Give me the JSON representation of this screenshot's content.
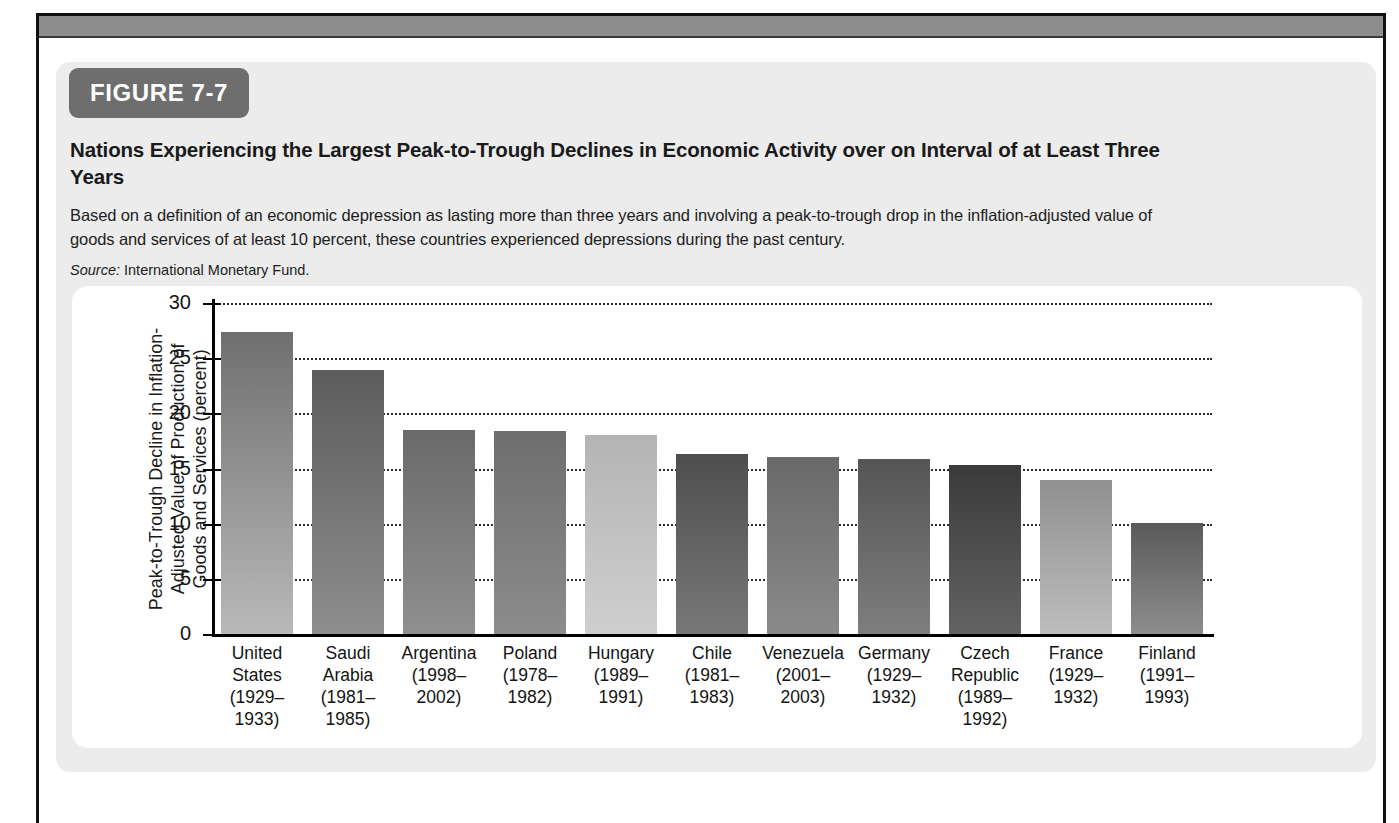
{
  "figure": {
    "badge": "FIGURE 7-7",
    "title": "Nations Experiencing the Largest Peak-to-Trough Declines in Economic Activity over on Interval of at Least Three Years",
    "description": "Based on a definition of an economic depression as lasting more than three years and involving a peak-to-trough drop in the inflation-adjusted value of goods and services of at least 10 percent, these countries experienced depressions during the past century.",
    "source_word": "Source:",
    "source_text": "International Monetary Fund."
  },
  "colors": {
    "badge_bg": "#6e6e6e",
    "card_bg": "#ececec",
    "panel_bg": "#ffffff",
    "axis": "#000000",
    "top_bar": "#8d8d8d"
  },
  "chart_data": {
    "type": "bar",
    "title": "Nations Experiencing the Largest Peak-to-Trough Declines in Economic Activity over on Interval of at Least Three Years",
    "xlabel": "",
    "ylabel": "Peak-to-Trough Decline in Inflation-Adjusted Value of Production of Goods and Services (percent)",
    "ylabel_lines": [
      "Peak-to-Trough Decline in Inflation-",
      "Adjusted Value of Production of",
      "Goods and Services (percent)"
    ],
    "ylim": [
      0,
      30
    ],
    "yticks": [
      0,
      5,
      10,
      15,
      20,
      25,
      30
    ],
    "ytick_labels": [
      "0",
      "5",
      "10",
      "15",
      "20",
      "25",
      "30"
    ],
    "grid": true,
    "grid_style": "dotted",
    "legend": "none",
    "categories": [
      "United States (1929–1933)",
      "Saudi Arabia (1981–1985)",
      "Argentina (1998–2002)",
      "Poland (1978–1982)",
      "Hungary (1989–1991)",
      "Chile (1981–1983)",
      "Venezuela (2001–2003)",
      "Germany (1929–1932)",
      "Czech Republic (1989–1992)",
      "France (1929–1932)",
      "Finland (1991–1993)"
    ],
    "category_lines": [
      [
        "United",
        "States",
        "(1929–",
        "1933)"
      ],
      [
        "Saudi",
        "Arabia",
        "(1981–",
        "1985)"
      ],
      [
        "Argentina",
        "(1998–",
        "2002)"
      ],
      [
        "Poland",
        "(1978–",
        "1982)"
      ],
      [
        "Hungary",
        "(1989–",
        "1991)"
      ],
      [
        "Chile",
        "(1981–",
        "1983)"
      ],
      [
        "Venezuela",
        "(2001–",
        "2003)"
      ],
      [
        "Germany",
        "(1929–",
        "1932)"
      ],
      [
        "Czech",
        "Republic",
        "(1989–",
        "1992)"
      ],
      [
        "France",
        "(1929–",
        "1932)"
      ],
      [
        "Finland",
        "(1991–",
        "1993)"
      ]
    ],
    "values": [
      27.4,
      23.9,
      18.5,
      18.4,
      18.0,
      16.3,
      16.0,
      15.9,
      15.3,
      14.0,
      10.1
    ],
    "bar_colors_top": [
      "#6f6f6f",
      "#5c5c5c",
      "#6a6a6a",
      "#6e6e6e",
      "#b4b4b4",
      "#4e4e4e",
      "#696969",
      "#555555",
      "#3a3a3a",
      "#909090",
      "#5a5a5a"
    ],
    "bar_colors_bottom": [
      "#b9b9b9",
      "#8e8e8e",
      "#8f8f8f",
      "#8c8c8c",
      "#cfcfcf",
      "#787878",
      "#8a8a8a",
      "#7e7e7e",
      "#636363",
      "#bdbdbd",
      "#8d8d8d"
    ]
  }
}
